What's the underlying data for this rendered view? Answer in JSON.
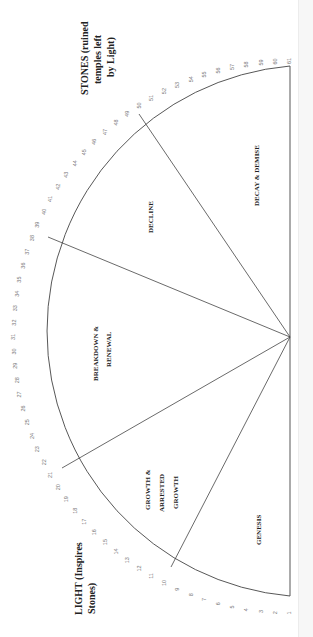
{
  "diagram": {
    "title_top": "STONES (ruined temples left by Light)",
    "title_top_lines": [
      "STONES (ruined",
      "temples left",
      "by Light)"
    ],
    "title_bottom": "LIGHT (Inspires Stones)",
    "title_bottom_lines": [
      "LIGHT (Inspires",
      "Stones)"
    ],
    "scale": {
      "min": 1,
      "max": 61,
      "ticks": [
        1,
        2,
        3,
        4,
        5,
        6,
        7,
        8,
        9,
        10,
        11,
        12,
        13,
        14,
        15,
        16,
        17,
        18,
        19,
        20,
        21,
        22,
        23,
        24,
        25,
        26,
        27,
        28,
        29,
        30,
        31,
        32,
        33,
        34,
        35,
        36,
        37,
        38,
        39,
        40,
        41,
        42,
        43,
        44,
        45,
        46,
        47,
        48,
        49,
        50,
        51,
        52,
        53,
        54,
        55,
        56,
        57,
        58,
        59,
        60,
        61
      ]
    },
    "sectors": [
      {
        "name": "GENESIS",
        "lines": [
          "GENESIS"
        ],
        "range": [
          1,
          8
        ]
      },
      {
        "name": "GROWTH & ARRESTED GROWTH",
        "lines": [
          "GROWTH &",
          "ARRESTED",
          "GROWTH"
        ],
        "range": [
          8,
          17
        ]
      },
      {
        "name": "BREAKDOWN & RENEWAL",
        "lines": [
          "BREAKDOWN &",
          "RENEWAL"
        ],
        "range": [
          17,
          34
        ]
      },
      {
        "name": "DECLINE",
        "lines": [
          "DECLINE"
        ],
        "range": [
          34,
          48
        ]
      },
      {
        "name": "DECAY & DEMISE",
        "lines": [
          "DECAY & DEMISE"
        ],
        "range": [
          48,
          61
        ]
      }
    ],
    "colors": {
      "line": "#444444",
      "tick_text": "#777777",
      "label_text": "#222222",
      "background": "#ffffff"
    }
  }
}
